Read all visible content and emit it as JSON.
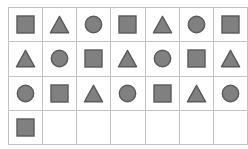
{
  "diagram": {
    "kind": "shape-sequence-table",
    "background_color": "#ffffff",
    "outer_border_color": "#b0b0b0",
    "grid_line_color": "#c2c2c2",
    "shape_fill_color": "#808080",
    "shape_stroke_color": "#5a5a5a",
    "columns": 7,
    "rows": 4,
    "shape_count": 22,
    "sequence_cycle": [
      "square",
      "triangle",
      "circle"
    ],
    "shape_names": {
      "square": "square-shape",
      "triangle": "triangle-shape",
      "circle": "circle-shape",
      "empty": "empty-cell"
    },
    "grid": [
      [
        "square",
        "triangle",
        "circle",
        "square",
        "triangle",
        "circle",
        "square"
      ],
      [
        "triangle",
        "circle",
        "square",
        "triangle",
        "circle",
        "square",
        "triangle"
      ],
      [
        "circle",
        "square",
        "triangle",
        "circle",
        "square",
        "triangle",
        "circle"
      ],
      [
        "square",
        "empty",
        "empty",
        "empty",
        "empty",
        "empty",
        "empty"
      ]
    ]
  }
}
